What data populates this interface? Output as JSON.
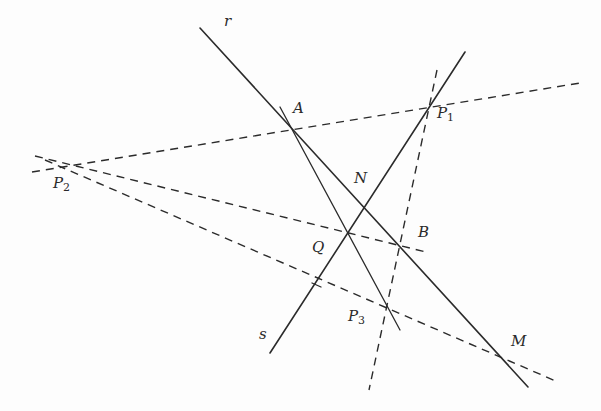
{
  "diagram": {
    "type": "projective-geometry-construction",
    "lines": [
      {
        "id": "r",
        "style": "solid",
        "label": "r",
        "x1": 200,
        "y1": 28,
        "x2": 528,
        "y2": 387
      },
      {
        "id": "s",
        "style": "solid",
        "label": "s",
        "x1": 270,
        "y1": 353,
        "x2": 465,
        "y2": 52
      },
      {
        "id": "A-P3",
        "style": "solid",
        "label": "",
        "x1": 280,
        "y1": 107,
        "x2": 400,
        "y2": 330
      },
      {
        "id": "P2-P1",
        "style": "dashed",
        "label": "",
        "x1": 32,
        "y1": 172,
        "x2": 580,
        "y2": 83
      },
      {
        "id": "P2-B",
        "style": "dashed",
        "label": "",
        "x1": 35,
        "y1": 156,
        "x2": 426,
        "y2": 252
      },
      {
        "id": "P2-M",
        "style": "dashed",
        "label": "",
        "x1": 45,
        "y1": 160,
        "x2": 558,
        "y2": 382
      },
      {
        "id": "P1-P3",
        "style": "dashed",
        "label": "",
        "x1": 437,
        "y1": 70,
        "x2": 369,
        "y2": 390
      }
    ],
    "points": [
      {
        "name": "A",
        "sub": "",
        "x": 290,
        "y": 128,
        "label_x": 293,
        "label_y": 101
      },
      {
        "name": "P",
        "sub": "1",
        "x": 429,
        "y": 107,
        "label_x": 437,
        "label_y": 112
      },
      {
        "name": "P",
        "sub": "2",
        "x": 60,
        "y": 166,
        "label_x": 53,
        "label_y": 176
      },
      {
        "name": "N",
        "sub": "",
        "x": 364,
        "y": 209,
        "label_x": 354,
        "label_y": 171
      },
      {
        "name": "Q",
        "sub": "",
        "x": 346,
        "y": 233,
        "label_x": 312,
        "label_y": 240
      },
      {
        "name": "B",
        "sub": "",
        "x": 398,
        "y": 246,
        "label_x": 418,
        "label_y": 225
      },
      {
        "name": "P",
        "sub": "3",
        "x": 386,
        "y": 305,
        "label_x": 348,
        "label_y": 309
      },
      {
        "name": "M",
        "sub": "",
        "x": 499,
        "y": 355,
        "label_x": 511,
        "label_y": 334
      }
    ],
    "line_labels": [
      {
        "name": "r",
        "label_x": 224,
        "label_y": 26
      },
      {
        "name": "s",
        "label_x": 259,
        "label_y": 327
      }
    ],
    "tick_marks": [
      {
        "at": "Q-on-s-lower",
        "x1": 312,
        "y1": 283,
        "x2": 320,
        "y2": 287
      }
    ]
  },
  "labels": {
    "r": "r",
    "s": "s",
    "A": "A",
    "P1": "P",
    "P1_sub": "1",
    "P2": "P",
    "P2_sub": "2",
    "P3": "P",
    "P3_sub": "3",
    "N": "N",
    "Q": "Q",
    "B": "B",
    "M": "M"
  },
  "colors": {
    "background": "#fdfdfd",
    "ink": "#2b2b2b"
  }
}
